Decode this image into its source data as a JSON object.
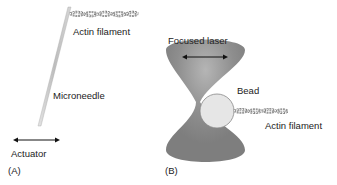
{
  "panel_a": {
    "tag": "(A)",
    "labels": {
      "actin": "Actin filament",
      "needle": "Microneedle",
      "actuator": "Actuator"
    }
  },
  "panel_b": {
    "tag": "(B)",
    "labels": {
      "laser": "Focused laser",
      "bead": "Bead",
      "actin": "Actin filament"
    }
  },
  "colors": {
    "laser": "#8a8a8a",
    "bead": "#e6e6e6",
    "needle": "#c8c8c8",
    "text": "#222222"
  }
}
